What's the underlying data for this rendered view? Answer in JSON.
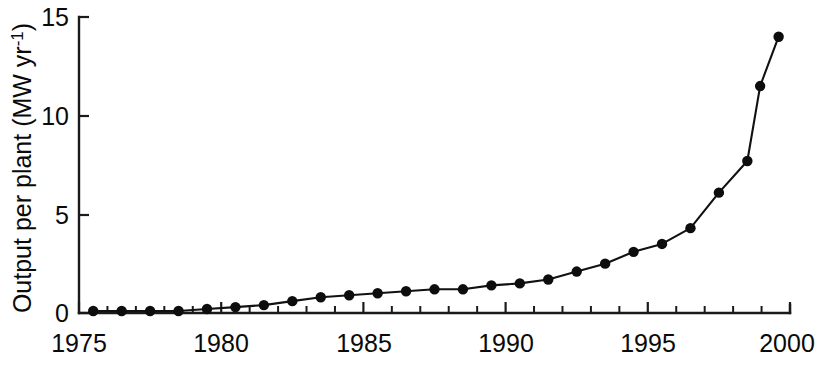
{
  "chart_data": {
    "type": "line",
    "title": "",
    "subtitle": "",
    "xlabel": "",
    "ylabel": "Output per plant (MW yr⁻¹)",
    "ylabel_parts": {
      "main": "Output per plant (MW yr",
      "superscript": "-1",
      "tail": ")"
    },
    "xlim": [
      1975,
      2000
    ],
    "ylim": [
      0,
      15
    ],
    "grid": false,
    "legend": null,
    "x_ticks_major": [
      1975,
      1980,
      1985,
      1990,
      1995,
      2000
    ],
    "x_tick_labels": [
      "1975",
      "1980",
      "1985",
      "1990",
      "1995",
      "2000"
    ],
    "x_ticks_minor_step": 1,
    "y_ticks_major": [
      0,
      5,
      10,
      15
    ],
    "y_tick_labels": [
      "0",
      "5",
      "10",
      "15"
    ],
    "marker": "filled-circle",
    "marker_color": "#0d0d0d",
    "line_color": "#111111",
    "x": [
      1975.5,
      1976.5,
      1977.5,
      1978.5,
      1979.5,
      1980.5,
      1981.5,
      1982.5,
      1983.5,
      1984.5,
      1985.5,
      1986.5,
      1987.5,
      1988.5,
      1989.5,
      1990.5,
      1991.5,
      1992.5,
      1993.5,
      1994.5,
      1995.5,
      1996.5,
      1997.5,
      1998.5,
      1999.5
    ],
    "values": [
      0.1,
      0.1,
      0.1,
      0.1,
      0.2,
      0.3,
      0.4,
      0.6,
      0.8,
      0.9,
      1.0,
      1.1,
      1.2,
      1.2,
      1.4,
      1.5,
      1.7,
      2.1,
      2.5,
      3.1,
      3.5,
      4.3,
      6.1,
      7.7,
      11.5
    ],
    "last_point": {
      "x": 1999.9,
      "y": 14.0
    },
    "series": [
      {
        "name": "Output per plant",
        "x": [
          1975.5,
          1976.5,
          1977.5,
          1978.5,
          1979.5,
          1980.5,
          1981.5,
          1982.5,
          1983.5,
          1984.5,
          1985.5,
          1986.5,
          1987.5,
          1988.5,
          1989.5,
          1990.5,
          1991.5,
          1992.5,
          1993.5,
          1994.5,
          1995.5,
          1996.5,
          1997.5,
          1998.5,
          1999.6
        ],
        "values": [
          0.1,
          0.1,
          0.1,
          0.1,
          0.2,
          0.3,
          0.4,
          0.6,
          0.8,
          0.9,
          1.0,
          1.1,
          1.2,
          1.2,
          1.4,
          1.5,
          1.7,
          2.1,
          2.5,
          3.1,
          3.5,
          4.3,
          6.1,
          7.7,
          14.0
        ]
      }
    ],
    "points": [
      {
        "x": 1975.5,
        "y": 0.1
      },
      {
        "x": 1976.5,
        "y": 0.1
      },
      {
        "x": 1977.5,
        "y": 0.1
      },
      {
        "x": 1978.5,
        "y": 0.1
      },
      {
        "x": 1979.5,
        "y": 0.2
      },
      {
        "x": 1980.5,
        "y": 0.3
      },
      {
        "x": 1981.5,
        "y": 0.4
      },
      {
        "x": 1982.5,
        "y": 0.6
      },
      {
        "x": 1983.5,
        "y": 0.8
      },
      {
        "x": 1984.5,
        "y": 0.9
      },
      {
        "x": 1985.5,
        "y": 1.0
      },
      {
        "x": 1986.5,
        "y": 1.1
      },
      {
        "x": 1987.5,
        "y": 1.2
      },
      {
        "x": 1988.5,
        "y": 1.2
      },
      {
        "x": 1989.5,
        "y": 1.4
      },
      {
        "x": 1990.5,
        "y": 1.5
      },
      {
        "x": 1991.5,
        "y": 1.7
      },
      {
        "x": 1992.5,
        "y": 2.1
      },
      {
        "x": 1993.5,
        "y": 2.5
      },
      {
        "x": 1994.5,
        "y": 3.1
      },
      {
        "x": 1995.5,
        "y": 3.5
      },
      {
        "x": 1996.5,
        "y": 4.3
      },
      {
        "x": 1997.5,
        "y": 6.1
      },
      {
        "x": 1998.5,
        "y": 7.7
      },
      {
        "x": 1998.95,
        "y": 11.5
      },
      {
        "x": 1999.6,
        "y": 14.0
      }
    ]
  }
}
